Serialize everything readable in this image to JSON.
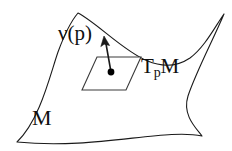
{
  "figure": {
    "kind": "differential-geometry-diagram",
    "background_color": "#ffffff",
    "stroke_color": "#1a1a1a",
    "point_color": "#000000"
  },
  "labels": {
    "normal_vector": "ν(p)",
    "tangent_space_main": "T",
    "tangent_space_sub": "p",
    "tangent_space_tail": "M",
    "manifold": "M"
  },
  "geometry": {
    "surface_corners": {
      "top_left": [
        78,
        13
      ],
      "top_right": [
        224,
        14
      ],
      "bottom_right": [
        202,
        136
      ],
      "bottom_left": [
        17,
        142
      ]
    },
    "tangent_plane_corners": {
      "top_left": [
        97,
        57
      ],
      "top_right": [
        141,
        57
      ],
      "bottom_right": [
        126,
        90
      ],
      "bottom_left": [
        82,
        90
      ]
    },
    "point_p": [
      111,
      72
    ],
    "vector_tip": [
      104,
      37
    ],
    "vector_tail": [
      111,
      72
    ]
  }
}
